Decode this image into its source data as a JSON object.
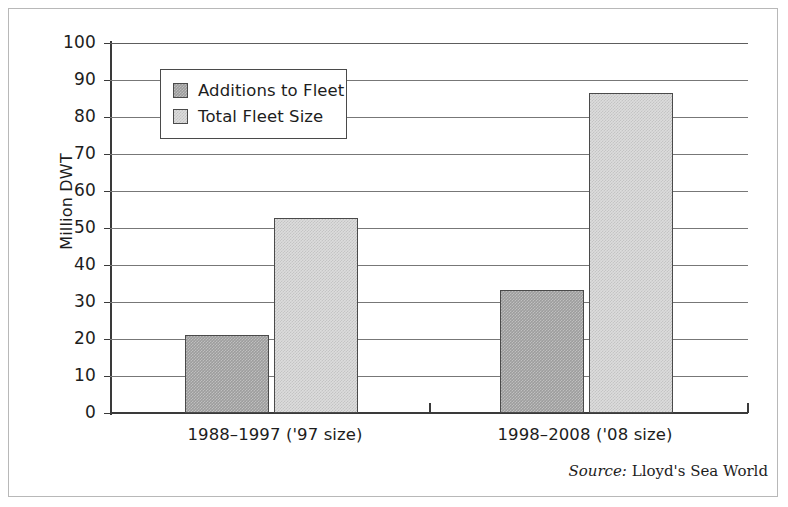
{
  "chart_data": {
    "type": "bar",
    "title": "",
    "xlabel": "",
    "ylabel": "Million DWT",
    "ylim": [
      0,
      100
    ],
    "ytick_step": 10,
    "ytick_labels": [
      "100",
      "90",
      "80",
      "70",
      "60",
      "50",
      "40",
      "30",
      "20",
      "10",
      "0"
    ],
    "grid": true,
    "legend_position": "upper-left-inside",
    "categories": [
      "1988–1997 ('97 size)",
      "1998–2008 ('08 size)"
    ],
    "series": [
      {
        "name": "Additions to Fleet",
        "values": [
          21.0,
          33.3
        ],
        "color": "#9d9d9d"
      },
      {
        "name": "Total Fleet Size",
        "values": [
          52.7,
          86.5
        ],
        "color": "#dcdcdc"
      }
    ],
    "source_key": "Source:",
    "source_value": " Lloyd's Sea World"
  }
}
